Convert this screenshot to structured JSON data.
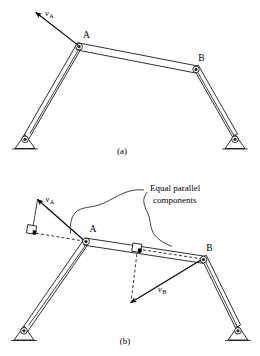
{
  "figure": {
    "background_color": "#ffffff",
    "line_color": "#1a1a1a",
    "panels": [
      {
        "id": "a",
        "caption": "(a)",
        "joint_labels": [
          "A",
          "B"
        ],
        "vectors": [
          {
            "name": "v_A",
            "symbol": "v",
            "subscript": "A",
            "at_joint": "A",
            "direction": "upper-left"
          }
        ],
        "annotations": []
      },
      {
        "id": "b",
        "caption": "(b)",
        "joint_labels": [
          "A",
          "B"
        ],
        "vectors": [
          {
            "name": "v_A",
            "symbol": "v",
            "subscript": "A",
            "at_joint": "A",
            "direction": "upper-left"
          },
          {
            "name": "v_B",
            "symbol": "v",
            "subscript": "B",
            "at_joint": "B",
            "direction": "lower-left"
          }
        ],
        "annotations": [
          {
            "name": "equal-parallel-components",
            "line1": "Equal parallel",
            "line2": "components"
          }
        ],
        "markers": [
          {
            "name": "right-angle-marker-a",
            "kind": "right-angle-square"
          },
          {
            "name": "right-angle-marker-b",
            "kind": "right-angle-square"
          }
        ]
      }
    ]
  },
  "labels": {
    "joint_a": "A",
    "joint_b": "B",
    "vector_symbol": "v",
    "sub_a": "A",
    "sub_b": "B",
    "note_line1": "Equal parallel",
    "note_line2": "components",
    "caption_a": "(a)",
    "caption_b": "(b)"
  }
}
